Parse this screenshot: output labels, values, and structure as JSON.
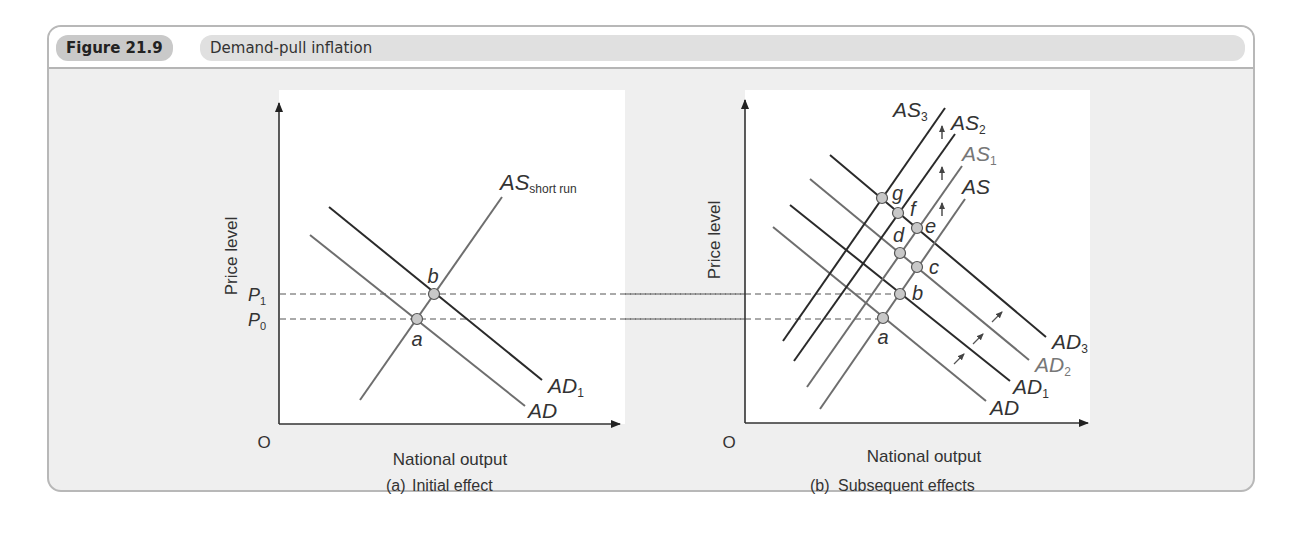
{
  "figure": {
    "number": "Figure 21.9",
    "title": "Demand-pull inflation"
  },
  "panel_a": {
    "ylabel": "Price level",
    "xlabel": "National output",
    "origin": "O",
    "caption_tag": "(a)",
    "caption": "Initial effect",
    "price_labels": [
      {
        "main": "P",
        "sub": "1"
      },
      {
        "main": "P",
        "sub": "0"
      }
    ],
    "curves": {
      "as": {
        "main": "AS",
        "sub": "short run"
      },
      "ad": {
        "main": "AD",
        "sub": ""
      },
      "ad1": {
        "main": "AD",
        "sub": "1"
      }
    },
    "points": [
      "a",
      "b"
    ]
  },
  "panel_b": {
    "ylabel": "Price level",
    "xlabel": "National output",
    "origin": "O",
    "caption_tag": "(b)",
    "caption": "Subsequent effects",
    "curves": {
      "as": {
        "main": "AS",
        "sub": ""
      },
      "as1": {
        "main": "AS",
        "sub": "1"
      },
      "as2": {
        "main": "AS",
        "sub": "2"
      },
      "as3": {
        "main": "AS",
        "sub": "3"
      },
      "ad": {
        "main": "AD",
        "sub": ""
      },
      "ad1": {
        "main": "AD",
        "sub": "1"
      },
      "ad2": {
        "main": "AD",
        "sub": "2"
      },
      "ad3": {
        "main": "AD",
        "sub": "3"
      }
    },
    "points": [
      "a",
      "b",
      "c",
      "d",
      "e",
      "f",
      "g"
    ]
  },
  "colors": {
    "dark_line": "#2a2a2a",
    "grey_line": "#6e6e6e",
    "point_fill": "#c8c8c8",
    "frame_bg": "#efefef",
    "header_pill": "#c9c9c9",
    "title_pill": "#e0e0e0"
  }
}
